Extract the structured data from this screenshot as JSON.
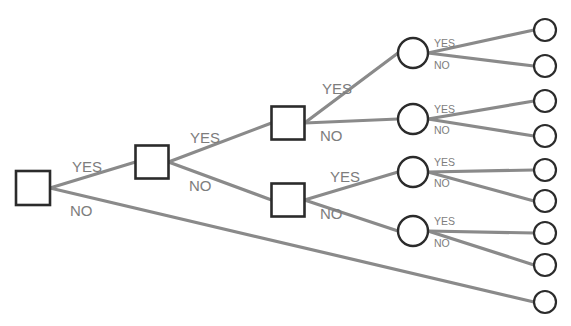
{
  "diagram": {
    "type": "decision-tree",
    "title_fragment": "",
    "colors": {
      "edge": "#8a8a8a",
      "node_stroke": "#2b2b2b",
      "node_fill": "#ffffff",
      "label_text": "#7d7d7d",
      "background": "#ffffff"
    },
    "labels": {
      "yes": "YES",
      "no": "NO"
    },
    "nodes": [
      {
        "id": "d0",
        "shape": "square",
        "x": 33,
        "y": 188,
        "size": 34
      },
      {
        "id": "d1",
        "shape": "square",
        "x": 152,
        "y": 162,
        "size": 33
      },
      {
        "id": "d2",
        "shape": "square",
        "x": 288,
        "y": 123,
        "size": 33
      },
      {
        "id": "d3",
        "shape": "square",
        "x": 288,
        "y": 200,
        "size": 33
      },
      {
        "id": "c1",
        "shape": "circle",
        "x": 413,
        "y": 53,
        "r": 15
      },
      {
        "id": "c2",
        "shape": "circle",
        "x": 413,
        "y": 119,
        "r": 15
      },
      {
        "id": "c3",
        "shape": "circle",
        "x": 413,
        "y": 172,
        "r": 15
      },
      {
        "id": "c4",
        "shape": "circle",
        "x": 413,
        "y": 231,
        "r": 15
      },
      {
        "id": "t1",
        "shape": "terminal",
        "x": 545,
        "y": 30,
        "r": 11
      },
      {
        "id": "t2",
        "shape": "terminal",
        "x": 545,
        "y": 66,
        "r": 11
      },
      {
        "id": "t3",
        "shape": "terminal",
        "x": 545,
        "y": 101,
        "r": 11
      },
      {
        "id": "t4",
        "shape": "terminal",
        "x": 545,
        "y": 136,
        "r": 11
      },
      {
        "id": "t5",
        "shape": "terminal",
        "x": 545,
        "y": 170,
        "r": 11
      },
      {
        "id": "t6",
        "shape": "terminal",
        "x": 545,
        "y": 201,
        "r": 11
      },
      {
        "id": "t7",
        "shape": "terminal",
        "x": 545,
        "y": 233,
        "r": 11
      },
      {
        "id": "t8",
        "shape": "terminal",
        "x": 545,
        "y": 265,
        "r": 11
      },
      {
        "id": "t9",
        "shape": "terminal",
        "x": 545,
        "y": 302,
        "r": 11
      }
    ],
    "edges": [
      {
        "id": "e1",
        "from": "d0",
        "to": "d1",
        "answer": "YES",
        "label_x": 72,
        "label_y": 168,
        "label_size": "lg"
      },
      {
        "id": "e2",
        "from": "d0",
        "to": "t9",
        "answer": "NO",
        "label_x": 70,
        "label_y": 212,
        "label_size": "lg"
      },
      {
        "id": "e3",
        "from": "d1",
        "to": "d2",
        "answer": "YES",
        "label_x": 190,
        "label_y": 139,
        "label_size": "lg"
      },
      {
        "id": "e4",
        "from": "d1",
        "to": "d3",
        "answer": "NO",
        "label_x": 189,
        "label_y": 187,
        "label_size": "lg"
      },
      {
        "id": "e5",
        "from": "d2",
        "to": "c1",
        "answer": "YES",
        "label_x": 322,
        "label_y": 90,
        "label_size": "lg"
      },
      {
        "id": "e6",
        "from": "d2",
        "to": "c2",
        "answer": "NO",
        "label_x": 320,
        "label_y": 137,
        "label_size": "lg"
      },
      {
        "id": "e7",
        "from": "d3",
        "to": "c3",
        "answer": "YES",
        "label_x": 330,
        "label_y": 178,
        "label_size": "lg"
      },
      {
        "id": "e8",
        "from": "d3",
        "to": "c4",
        "answer": "NO",
        "label_x": 320,
        "label_y": 215,
        "label_size": "lg"
      },
      {
        "id": "e9",
        "from": "c1",
        "to": "t1",
        "answer": "YES",
        "label_x": 434,
        "label_y": 44,
        "label_size": "sm"
      },
      {
        "id": "e10",
        "from": "c1",
        "to": "t2",
        "answer": "NO",
        "label_x": 434,
        "label_y": 66,
        "label_size": "sm"
      },
      {
        "id": "e11",
        "from": "c2",
        "to": "t3",
        "answer": "YES",
        "label_x": 434,
        "label_y": 110,
        "label_size": "sm"
      },
      {
        "id": "e12",
        "from": "c2",
        "to": "t4",
        "answer": "NO",
        "label_x": 434,
        "label_y": 131,
        "label_size": "sm"
      },
      {
        "id": "e13",
        "from": "c3",
        "to": "t5",
        "answer": "YES",
        "label_x": 434,
        "label_y": 163,
        "label_size": "sm"
      },
      {
        "id": "e14",
        "from": "c3",
        "to": "t6",
        "answer": "NO",
        "label_x": 434,
        "label_y": 184,
        "label_size": "sm"
      },
      {
        "id": "e15",
        "from": "c4",
        "to": "t7",
        "answer": "YES",
        "label_x": 434,
        "label_y": 222,
        "label_size": "sm"
      },
      {
        "id": "e16",
        "from": "c4",
        "to": "t8",
        "answer": "NO",
        "label_x": 434,
        "label_y": 244,
        "label_size": "sm"
      }
    ]
  }
}
